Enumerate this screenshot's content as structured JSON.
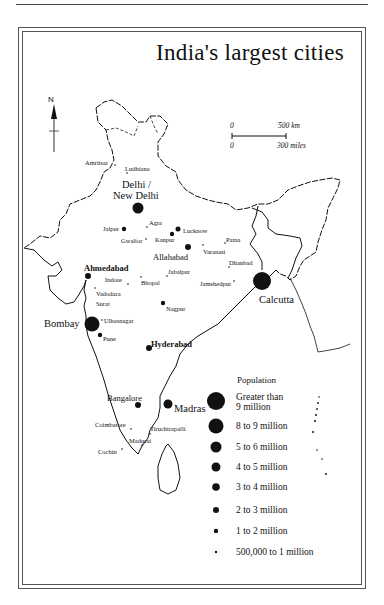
{
  "title": "India's largest cities",
  "compass": {
    "label": "N",
    "icon": "north-arrow-icon"
  },
  "scale_bar": {
    "km_start": "0",
    "km_end": "500 km",
    "mi_start": "0",
    "mi_end": "300 miles"
  },
  "cities": {
    "amritsar": "Amritsar",
    "ludhiana": "Ludhiana",
    "delhi_line1": "Delhi /",
    "delhi_line2": "New Delhi",
    "jaipur": "Jaipur",
    "agra": "Agra",
    "gwalior": "Gwalior",
    "kanpur": "Kanpur",
    "lucknow": "Lucknow",
    "allahabad": "Allahabad",
    "varanasi": "Varanasi",
    "patna": "Patna",
    "dhanbad": "Dhanbad",
    "jamshedpur": "Jamshedpur",
    "calcutta": "Calcutta",
    "ahmedabad": "Ahmedabad",
    "indore": "Indore",
    "bhopal": "Bhopal",
    "jabalpur": "Jabalpur",
    "vadodara": "Vadodara",
    "surat": "Surat",
    "nagpur": "Nagpur",
    "bombay": "Bombay",
    "ulhasnagar": "Ulhasnagar",
    "pune": "Pune",
    "hyderabad": "Hyderabad",
    "bangalore": "Bangalore",
    "madras": "Madras",
    "coimbatore": "Coimbatore",
    "tiruchirapalli": "Tiruchirapalli",
    "madurai": "Madurai",
    "cochin": "Cochin"
  },
  "legend": {
    "title": "Population",
    "items": [
      {
        "label_line1": "Greater than",
        "label_line2": "9 million",
        "size": 9
      },
      {
        "label_line1": "8 to 9 million",
        "size": 7.5
      },
      {
        "label_line1": "5 to 6 million",
        "size": 5.5
      },
      {
        "label_line1": "4 to 5 million",
        "size": 4.5
      },
      {
        "label_line1": "3 to 4 million",
        "size": 3.8
      },
      {
        "label_line1": "2 to 3 million",
        "size": 3
      },
      {
        "label_line1": "1 to 2 million",
        "size": 2.2
      },
      {
        "label_line1": "500,000 to 1 million",
        "size": 1.2
      }
    ]
  },
  "colors": {
    "ink": "#111111",
    "background": "#ffffff",
    "frame": "#555555"
  }
}
